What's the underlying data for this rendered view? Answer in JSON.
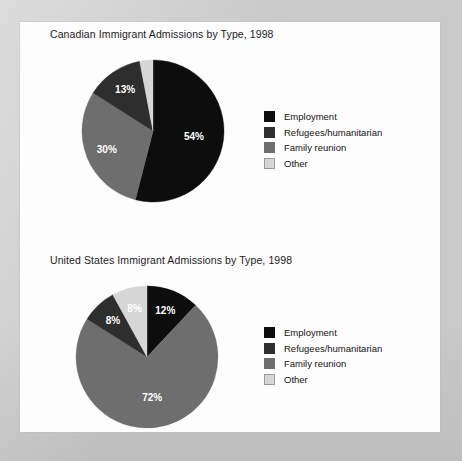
{
  "theme": {
    "outer_background": "#c9c9c9",
    "page_background": "#fdfdfd",
    "text_color": "#1c1c1c",
    "colors": {
      "employment": "#0d0d0d",
      "refugees_humanitarian": "#2e2e2e",
      "family_reunion": "#6e6e6e",
      "other": "#d6d6d6"
    }
  },
  "legend_labels": {
    "employment": "Employment",
    "refugees": "Refugees/humanitarian",
    "family": "Family reunion",
    "other": "Other"
  },
  "chart_data": [
    {
      "type": "pie",
      "id": "canada-1998",
      "title": "Canadian Immigrant Admissions by Type, 1998",
      "xlabel": "",
      "ylabel": "",
      "legend_position": "right",
      "grid": false,
      "units": "percent",
      "categories": [
        "Employment",
        "Family reunion",
        "Refugees/humanitarian",
        "Other"
      ],
      "values": [
        54,
        30,
        13,
        3
      ],
      "labels": [
        "54%",
        "30%",
        "13%",
        "3%"
      ],
      "colors": [
        "#0d0d0d",
        "#6e6e6e",
        "#2e2e2e",
        "#d6d6d6"
      ],
      "label_fill": [
        "#ffffff",
        "#ffffff",
        "#ffffff",
        "#1a1a1a"
      ],
      "label_outside": [
        false,
        false,
        false,
        true
      ],
      "legend": [
        {
          "label": "Employment",
          "color": "#0d0d0d",
          "bordered": false
        },
        {
          "label": "Refugees/humanitarian",
          "color": "#2e2e2e",
          "bordered": false
        },
        {
          "label": "Family reunion",
          "color": "#6e6e6e",
          "bordered": false
        },
        {
          "label": "Other",
          "color": "#d6d6d6",
          "bordered": true
        }
      ]
    },
    {
      "type": "pie",
      "id": "usa-1998",
      "title": "United States Immigrant Admissions by Type, 1998",
      "xlabel": "",
      "ylabel": "",
      "legend_position": "right",
      "grid": false,
      "units": "percent",
      "categories": [
        "Employment",
        "Family reunion",
        "Refugees/humanitarian",
        "Other"
      ],
      "values": [
        12,
        72,
        8,
        8
      ],
      "labels": [
        "12%",
        "72%",
        "8%",
        "8%"
      ],
      "colors": [
        "#0d0d0d",
        "#6e6e6e",
        "#2e2e2e",
        "#d6d6d6"
      ],
      "label_fill": [
        "#ffffff",
        "#ffffff",
        "#ffffff",
        "#1a1a1a"
      ],
      "label_outside": [
        false,
        false,
        false,
        false
      ],
      "legend": [
        {
          "label": "Employment",
          "color": "#0d0d0d",
          "bordered": false
        },
        {
          "label": "Refugees/humanitarian",
          "color": "#2e2e2e",
          "bordered": false
        },
        {
          "label": "Family reunion",
          "color": "#6e6e6e",
          "bordered": false
        },
        {
          "label": "Other",
          "color": "#d6d6d6",
          "bordered": true
        }
      ]
    }
  ]
}
